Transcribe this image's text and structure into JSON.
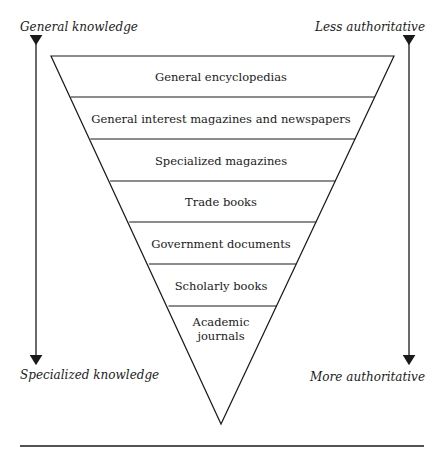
{
  "diagram": {
    "type": "inverted-pyramid",
    "left_axis": {
      "top_label": "General knowledge",
      "bottom_label": "Specialized knowledge"
    },
    "right_axis": {
      "top_label": "Less authoritative",
      "bottom_label": "More authoritative"
    },
    "levels": [
      {
        "label": "General encyclopedias"
      },
      {
        "label": "General interest magazines and newspapers"
      },
      {
        "label": "Specialized magazines"
      },
      {
        "label": "Trade books"
      },
      {
        "label": "Government documents"
      },
      {
        "label": "Scholarly books"
      },
      {
        "label": "Academic\njournals"
      }
    ]
  }
}
